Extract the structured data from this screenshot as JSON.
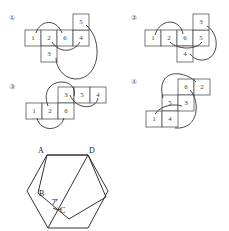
{
  "nets": [
    {
      "label": "①",
      "faces": [
        "1",
        "2",
        "6",
        "4",
        "5",
        "3"
      ]
    },
    {
      "label": "②",
      "faces": [
        "1",
        "2",
        "6",
        "5",
        "3",
        "4"
      ]
    },
    {
      "label": "③",
      "faces": [
        "3",
        "5",
        "4",
        "1",
        "2",
        "6"
      ]
    },
    {
      "label": "④",
      "faces": [
        "6",
        "2",
        "5",
        "3",
        "1",
        "4"
      ]
    }
  ],
  "figure": {
    "points": {
      "A": "A",
      "B": "B",
      "C": "C",
      "D": "D"
    },
    "angle_label": "ア"
  }
}
